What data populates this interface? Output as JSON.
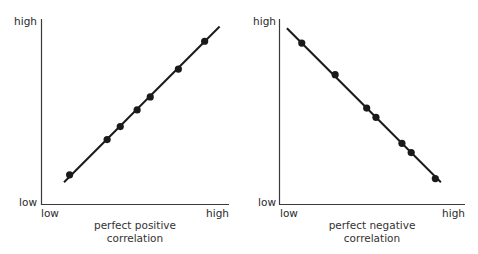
{
  "chart_data": [
    {
      "type": "scatter",
      "title": "perfect positive correlation",
      "caption_lines": [
        "perfect positive",
        "correlation"
      ],
      "xlabel": "",
      "ylabel": "",
      "x_tick_labels": {
        "low": "low",
        "high": "high"
      },
      "y_tick_labels": {
        "low": "low",
        "high": "high"
      },
      "xlim": [
        0,
        100
      ],
      "ylim": [
        0,
        100
      ],
      "grid": false,
      "legend": "none",
      "trend_line": {
        "from": [
          12,
          12
        ],
        "to": [
          95,
          96
        ]
      },
      "points": [
        {
          "x": 15,
          "y": 16
        },
        {
          "x": 35,
          "y": 35
        },
        {
          "x": 42,
          "y": 42
        },
        {
          "x": 51,
          "y": 51
        },
        {
          "x": 58,
          "y": 58
        },
        {
          "x": 73,
          "y": 73
        },
        {
          "x": 87,
          "y": 88
        }
      ]
    },
    {
      "type": "scatter",
      "title": "perfect negative correlation",
      "caption_lines": [
        "perfect negative",
        "correlation"
      ],
      "xlabel": "",
      "ylabel": "",
      "x_tick_labels": {
        "low": "low",
        "high": "high"
      },
      "y_tick_labels": {
        "low": "low",
        "high": "high"
      },
      "xlim": [
        0,
        100
      ],
      "ylim": [
        0,
        100
      ],
      "grid": false,
      "legend": "none",
      "trend_line": {
        "from": [
          4,
          95
        ],
        "to": [
          87,
          12
        ]
      },
      "points": [
        {
          "x": 12,
          "y": 87
        },
        {
          "x": 30,
          "y": 70
        },
        {
          "x": 47,
          "y": 52
        },
        {
          "x": 52,
          "y": 47
        },
        {
          "x": 66,
          "y": 33
        },
        {
          "x": 71,
          "y": 28
        },
        {
          "x": 84,
          "y": 14
        }
      ]
    }
  ],
  "colors": {
    "line": "#1a1a1a",
    "axis": "#3a3a3a",
    "text": "#2a2a2a",
    "background": "#ffffff"
  }
}
